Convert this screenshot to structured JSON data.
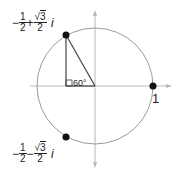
{
  "diagram": {
    "type": "unit-circle-complex-roots",
    "colors": {
      "circle": "#9a9a9a",
      "axis": "#b0b0b0",
      "triangle": "#444444",
      "point": "#111111",
      "text": "#222222"
    },
    "angle_label": "60°",
    "point_right_label": "1",
    "point_top": {
      "sign": "−",
      "real_num": "1",
      "real_den": "2",
      "op": "+",
      "imag_rad": "3",
      "imag_den": "2",
      "unit": "i"
    },
    "point_bottom": {
      "sign": "−",
      "real_num": "1",
      "real_den": "2",
      "op": "−",
      "imag_rad": "3",
      "imag_den": "2",
      "unit": "i"
    },
    "sqrt_symbol": "√"
  }
}
